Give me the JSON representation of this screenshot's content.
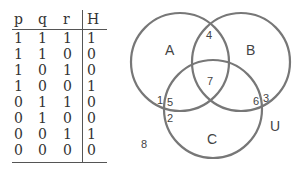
{
  "truth_table": {
    "headers": [
      "p",
      "q",
      "r",
      "H"
    ],
    "rows": [
      [
        "1",
        "1",
        "1",
        "1"
      ],
      [
        "1",
        "1",
        "0",
        "0"
      ],
      [
        "1",
        "0",
        "1",
        "0"
      ],
      [
        "1",
        "0",
        "0",
        "1"
      ],
      [
        "0",
        "1",
        "1",
        "0"
      ],
      [
        "0",
        "1",
        "0",
        "0"
      ],
      [
        "0",
        "0",
        "1",
        "1"
      ],
      [
        "0",
        "0",
        "0",
        "0"
      ]
    ]
  },
  "venn": {
    "sets": [
      {
        "label": "A"
      },
      {
        "label": "B"
      },
      {
        "label": "C"
      }
    ],
    "universe_label": "U",
    "regions": {
      "r1": "1",
      "r2": "2",
      "r3": "3",
      "r4": "4",
      "r5": "5",
      "r6": "6",
      "r7": "7",
      "r8": "8"
    },
    "stroke_color": "#777777"
  }
}
